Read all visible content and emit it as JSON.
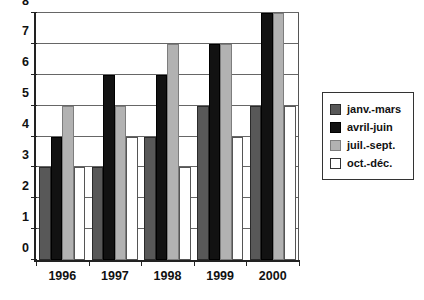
{
  "chart_data": {
    "type": "bar",
    "title": "",
    "subtitle": "",
    "xlabel": "",
    "ylabel": "",
    "categories": [
      "1996",
      "1997",
      "1998",
      "1999",
      "2000"
    ],
    "series": [
      {
        "name": "janv.-mars",
        "color": "#585858",
        "values": [
          3,
          3,
          4,
          5,
          5
        ]
      },
      {
        "name": "avril-juin",
        "color": "#121212",
        "values": [
          4,
          6,
          6,
          7,
          8
        ]
      },
      {
        "name": "juil.-sept.",
        "color": "#b2b2b2",
        "values": [
          5,
          5,
          7,
          7,
          8
        ]
      },
      {
        "name": "oct.-déc.",
        "color": "#ffffff",
        "values": [
          3,
          4,
          3,
          4,
          5
        ]
      }
    ],
    "ylim": [
      0,
      8
    ],
    "yticks": [
      0,
      1,
      2,
      3,
      4,
      5,
      6,
      7,
      8
    ],
    "ytick_labels": [
      "0",
      "1",
      "2",
      "3",
      "4",
      "5",
      "6",
      "7",
      "8"
    ],
    "grid": true,
    "grid_axis": "y",
    "legend_position": "right",
    "bar_grouping": "grouped",
    "annotations": []
  },
  "legend": {
    "items": [
      {
        "label": "janv.-mars"
      },
      {
        "label": "avril-juin"
      },
      {
        "label": "juil.-sept."
      },
      {
        "label": "oct.-déc."
      }
    ]
  },
  "axes": {
    "y_tick_labels": [
      "0",
      "1",
      "2",
      "3",
      "4",
      "5",
      "6",
      "7",
      "8"
    ],
    "x_tick_labels": [
      "1996",
      "1997",
      "1998",
      "1999",
      "2000"
    ]
  }
}
